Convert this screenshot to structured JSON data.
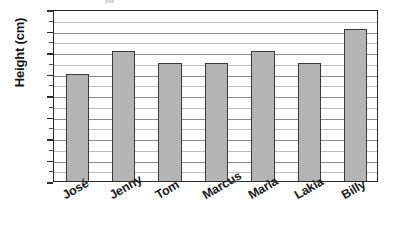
{
  "chart_data": {
    "type": "bar",
    "title": "",
    "xlabel": "",
    "ylabel": "Height (cm)",
    "categories": [
      "José",
      "Jenny",
      "Tom",
      "Marcus",
      "Maria",
      "Lakia",
      "Billy"
    ],
    "values": [
      100,
      121,
      110,
      110,
      121,
      110,
      141
    ],
    "ylim": [
      0,
      160
    ],
    "ytick_major_step": 20,
    "ytick_minor_step": 10,
    "ytick_labels": [
      "0",
      "20",
      "40",
      "60",
      "80",
      "100",
      "120",
      "140",
      "160"
    ],
    "ytick_values": [
      0,
      20,
      40,
      60,
      80,
      100,
      120,
      140,
      160
    ],
    "grid": "horizontal",
    "legend": "none",
    "bar_color": "#b4b4b4",
    "bar_border_color": "#3a3a3a",
    "axis_color": "#2b2b2b",
    "gridline_color": "#9d9d9d",
    "text_color": "#131313",
    "background": "#ffffff",
    "xlabel_rotation_deg": -30
  }
}
